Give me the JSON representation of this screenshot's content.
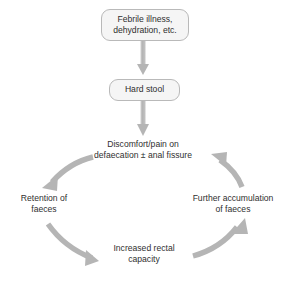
{
  "diagram": {
    "background_color": "#ffffff",
    "arrow_color": "#b5b5b5",
    "box_fill_color": "#f5f5f5",
    "box_border_color": "#b9b9b9",
    "text_color": "#2f2f2f"
  },
  "nodes": {
    "trigger": {
      "line1": "Febrile illness,",
      "line2": "dehydration, etc."
    },
    "hard_stool": {
      "label": "Hard stool"
    },
    "discomfort": {
      "line1": "Discomfort/pain on",
      "line2": "defaecation ± anal fissure"
    },
    "retention": {
      "line1": "Retention of",
      "line2": "faeces"
    },
    "capacity": {
      "line1": "Increased rectal",
      "line2": "capacity"
    },
    "accumulation": {
      "line1": "Further accumulation",
      "line2": "of faeces"
    }
  },
  "connectors": [
    {
      "name": "trigger-to-hard-stool",
      "kind": "straight-down-arrow"
    },
    {
      "name": "hard-stool-to-discomfort",
      "kind": "straight-down-arrow"
    },
    {
      "name": "discomfort-to-retention",
      "kind": "curved-arrow"
    },
    {
      "name": "retention-to-capacity",
      "kind": "curved-arrow"
    },
    {
      "name": "capacity-to-accumulation",
      "kind": "curved-arrow"
    },
    {
      "name": "accumulation-to-discomfort",
      "kind": "curved-arrow"
    }
  ]
}
